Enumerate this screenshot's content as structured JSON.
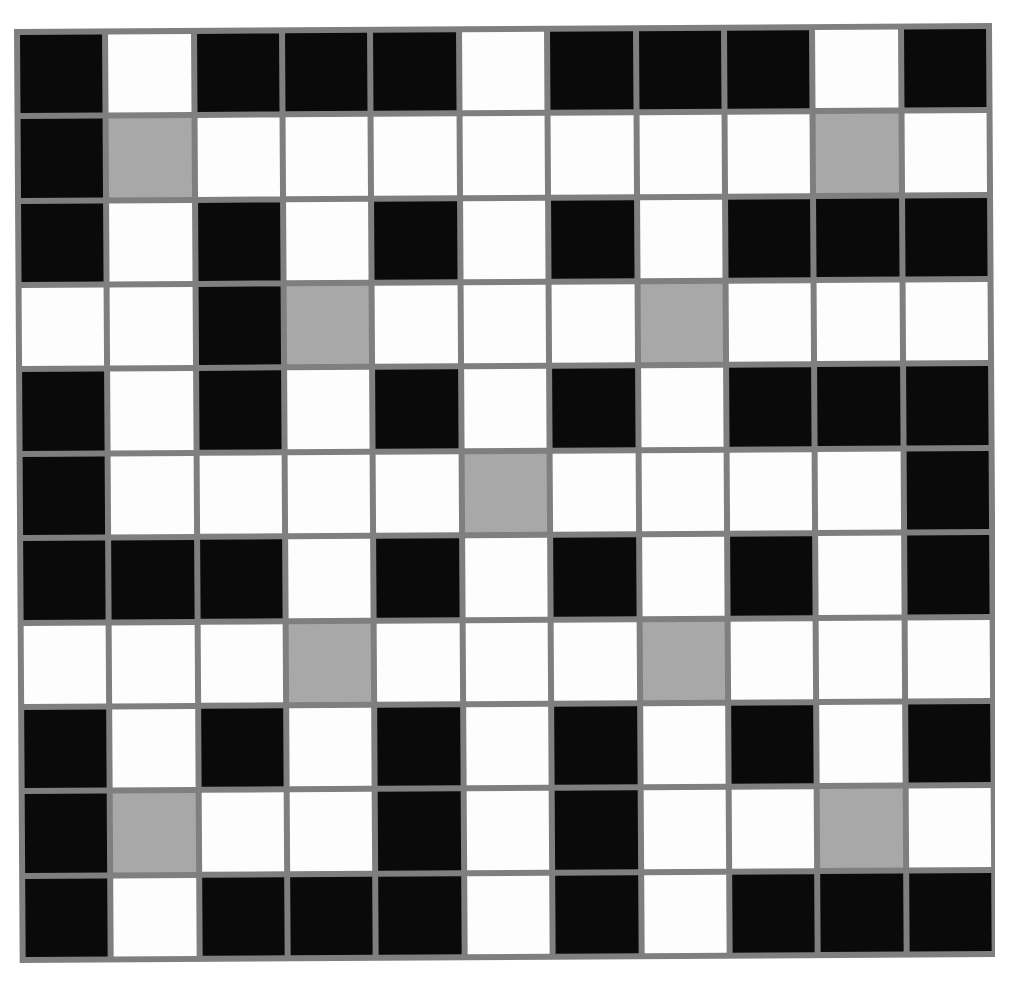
{
  "image": {
    "kind": "grid-pattern",
    "description": "Scanned black, white and gray square grid pattern",
    "width": 1009,
    "height": 983
  },
  "grid": {
    "rows": 11,
    "columns": 11,
    "gridline_color": "#7f7f7f",
    "gridline_width_px": 6,
    "palette": {
      "black": "#0a0a0a",
      "white": "#fdfdfd",
      "gray": "#a8a8a8"
    },
    "legend": {
      "k": "black",
      "w": "white",
      "g": "gray"
    },
    "counts": {
      "black": 51,
      "white": 60,
      "gray": 10,
      "total": 121
    },
    "cells": [
      [
        "k",
        "w",
        "k",
        "k",
        "k",
        "w",
        "k",
        "k",
        "k",
        "w",
        "k"
      ],
      [
        "k",
        "g",
        "w",
        "w",
        "w",
        "w",
        "w",
        "w",
        "w",
        "g",
        "w"
      ],
      [
        "k",
        "w",
        "k",
        "w",
        "k",
        "w",
        "k",
        "w",
        "k",
        "k",
        "k"
      ],
      [
        "w",
        "w",
        "k",
        "g",
        "w",
        "w",
        "w",
        "g",
        "w",
        "w",
        "w"
      ],
      [
        "k",
        "w",
        "k",
        "w",
        "k",
        "w",
        "k",
        "w",
        "k",
        "k",
        "k"
      ],
      [
        "k",
        "w",
        "w",
        "w",
        "w",
        "g",
        "w",
        "w",
        "w",
        "w",
        "k"
      ],
      [
        "k",
        "k",
        "k",
        "w",
        "k",
        "w",
        "k",
        "w",
        "k",
        "w",
        "k"
      ],
      [
        "w",
        "w",
        "w",
        "g",
        "w",
        "w",
        "w",
        "g",
        "w",
        "w",
        "w"
      ],
      [
        "k",
        "w",
        "k",
        "w",
        "k",
        "w",
        "k",
        "w",
        "k",
        "w",
        "k"
      ],
      [
        "k",
        "g",
        "w",
        "w",
        "k",
        "w",
        "k",
        "w",
        "w",
        "g",
        "w"
      ],
      [
        "k",
        "w",
        "k",
        "k",
        "k",
        "w",
        "k",
        "w",
        "k",
        "k",
        "k"
      ]
    ]
  }
}
